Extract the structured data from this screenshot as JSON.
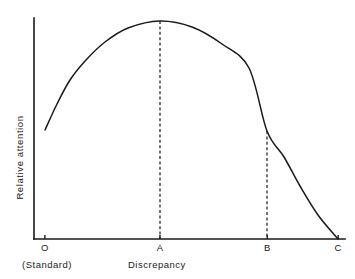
{
  "figure": {
    "background_color": "#ffffff",
    "ink_color": "#1a1a1a"
  },
  "axes": {
    "y_title": "Relative attention",
    "x_title": "Discrepancy",
    "standard_note": "(Standard)"
  },
  "ticks": {
    "o": "O",
    "a": "A",
    "b": "B",
    "c": "C"
  },
  "chart_data": {
    "type": "line",
    "title": "",
    "subtitle": "",
    "xlabel": "Discrepancy",
    "ylabel": "Relative attention",
    "grid": false,
    "legend": null,
    "xlim": [
      0,
      1
    ],
    "ylim": [
      0,
      1
    ],
    "x_tick_labels": [
      "O",
      "A",
      "B",
      "C"
    ],
    "x_tick_values": [
      0.035,
      0.405,
      0.75,
      0.978
    ],
    "y_tick_labels": [],
    "annotations": [
      {
        "text": "(Standard)",
        "at_tick": "O",
        "position": "below-axis"
      }
    ],
    "dropline_ticks": [
      "A",
      "B"
    ],
    "series": [
      {
        "name": "Relative attention vs discrepancy",
        "style": "solid",
        "x": [
          0.035,
          0.075,
          0.12,
          0.175,
          0.24,
          0.31,
          0.405,
          0.5,
          0.59,
          0.67,
          0.75,
          0.8,
          0.85,
          0.905,
          0.978
        ],
        "y": [
          0.493,
          0.61,
          0.718,
          0.81,
          0.888,
          0.95,
          1.0,
          0.975,
          0.9,
          0.79,
          0.645,
          0.53,
          0.4,
          0.245,
          0.0
        ]
      }
    ],
    "curve_points_px": [
      [
        45,
        130
      ],
      [
        57,
        104
      ],
      [
        70,
        80
      ],
      [
        86,
        60
      ],
      [
        105,
        42
      ],
      [
        128,
        28
      ],
      [
        160,
        21
      ],
      [
        192,
        27
      ],
      [
        222,
        44
      ],
      [
        249,
        68
      ],
      [
        267,
        131
      ],
      [
        284,
        157
      ],
      [
        300,
        186
      ],
      [
        318,
        215
      ],
      [
        338,
        239
      ]
    ],
    "droplines_px": [
      {
        "tick": "A",
        "x": 160,
        "y_top": 21,
        "y_bottom": 239
      },
      {
        "tick": "B",
        "x": 267,
        "y_top": 131,
        "y_bottom": 239
      }
    ],
    "axis_geometry_px": {
      "y_axis_x": 34,
      "y_axis_top": 18,
      "x_axis_y": 239,
      "x_axis_right": 345
    }
  }
}
